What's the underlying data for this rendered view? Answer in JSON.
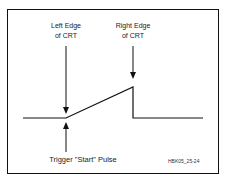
{
  "diagram": {
    "labels": {
      "left_edge_line1": "Left Edge",
      "left_edge_line2": "of CRT",
      "right_edge_line1": "Right Edge",
      "right_edge_line2": "of CRT",
      "trigger": "Trigger \"Start\" Pulse",
      "figure_id": "HBK05_25-24"
    },
    "waveform": {
      "baseline_y": 118,
      "ramp_start_x": 66,
      "ramp_end_x": 133,
      "ramp_peak_y": 87,
      "line_start_x": 23,
      "line_end_x": 203
    },
    "stroke_color": "#111111"
  }
}
